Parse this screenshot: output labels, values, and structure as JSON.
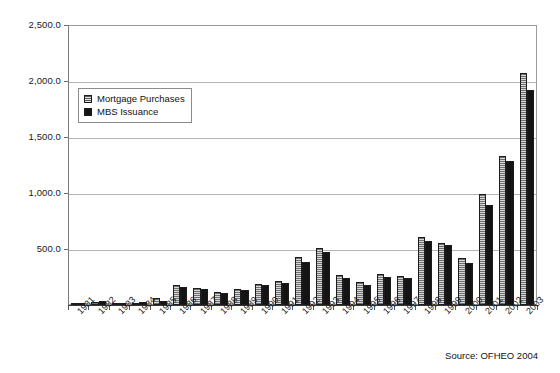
{
  "chart_data": {
    "type": "bar",
    "title": "",
    "subtitle": "",
    "xlabel": "",
    "ylabel": "",
    "ylim": [
      0,
      2500
    ],
    "ytick_labels": [
      "2,500.0",
      "2,000.0",
      "1,500.0",
      "1,000.0",
      "500.0"
    ],
    "ytick_values": [
      2500,
      2000,
      1500,
      1000,
      500
    ],
    "grid": "horizontal",
    "legend_position": "upper-left-inside",
    "categories": [
      "1981",
      "1982",
      "1983",
      "1984",
      "1985",
      "1986",
      "1987",
      "1988",
      "1989",
      "1990",
      "1991",
      "1992",
      "1993",
      "1994",
      "1995",
      "1996",
      "1997",
      "1998",
      "1999",
      "2000",
      "2001",
      "2002",
      "2003"
    ],
    "series": [
      {
        "name": "Mortgage Purchases",
        "color": "#8e8e8e",
        "pattern": "horizontal-hatch",
        "values": [
          12,
          27,
          16,
          22,
          60,
          175,
          150,
          120,
          145,
          190,
          210,
          430,
          510,
          270,
          205,
          275,
          255,
          610,
          550,
          420,
          990,
          1330,
          2070
        ]
      },
      {
        "name": "MBS Issuance",
        "color": "#141414",
        "pattern": "solid",
        "values": [
          5,
          32,
          20,
          26,
          38,
          165,
          140,
          110,
          135,
          175,
          195,
          385,
          470,
          240,
          180,
          250,
          245,
          575,
          535,
          375,
          895,
          1290,
          1920
        ]
      }
    ],
    "source": "Source: OFHEO 2004"
  },
  "legend": {
    "items": [
      {
        "label": "Mortgage Purchases",
        "swatch": "hatched-gray-swatch"
      },
      {
        "label": "MBS Issuance",
        "swatch": "solid-black-swatch"
      }
    ]
  },
  "footer": {
    "source_text": "Source: OFHEO 2004"
  }
}
